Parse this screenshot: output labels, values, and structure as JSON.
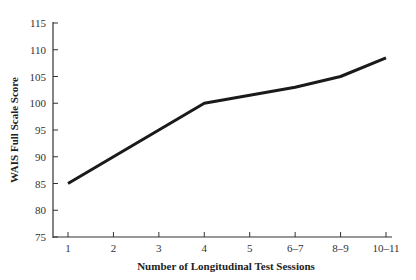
{
  "chart_data": {
    "type": "line",
    "title": "",
    "xlabel": "Number of Longitudinal Test Sessions",
    "ylabel": "WAIS Full Scale Score",
    "categories": [
      "1",
      "2",
      "3",
      "4",
      "5",
      "6–7",
      "8–9",
      "10–11"
    ],
    "series": [
      {
        "name": "WAIS Full Scale Score",
        "values": [
          85,
          90,
          95,
          100,
          101.5,
          103,
          105,
          108.5
        ]
      }
    ],
    "ylim": [
      75,
      115
    ],
    "yticks": [
      75,
      80,
      85,
      90,
      95,
      100,
      105,
      110,
      115
    ],
    "grid": false,
    "legend": "none"
  },
  "colors": {
    "line": "#1a1a1a",
    "axis": "#333333",
    "text": "#333333"
  }
}
